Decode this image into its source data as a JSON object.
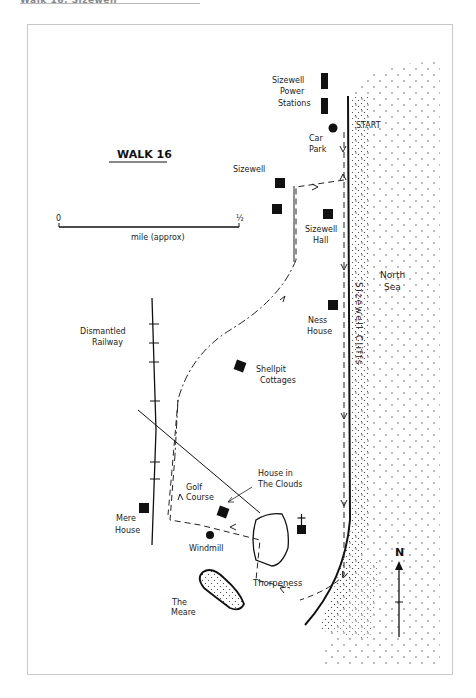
{
  "header": {
    "text": "Walk 16: Sizewell"
  },
  "map": {
    "title": "WALK 16",
    "scale": {
      "start": "0",
      "end": "½",
      "unit": "mile (approx)"
    },
    "labels": {
      "power_1": "Sizewell",
      "power_2": "Power",
      "power_3": "Stations",
      "start": "START",
      "carpark_1": "Car",
      "carpark_2": "Park",
      "sizewell": "Sizewell",
      "hall_1": "Sizewell",
      "hall_2": "Hall",
      "sea_1": "North",
      "sea_2": "Sea",
      "cliffs": "Sizewell Cliffs",
      "ness_1": "Ness",
      "ness_2": "House",
      "railway_1": "Dismantled",
      "railway_2": "Railway",
      "shellpit_1": "Shellpit",
      "shellpit_2": "Cottages",
      "clouds_1": "House in",
      "clouds_2": "The Clouds",
      "golf_1": "Golf",
      "golf_2": "Course",
      "mere_house_1": "Mere",
      "mere_house_2": "House",
      "windmill": "Windmill",
      "thorpeness": "Thorpeness",
      "meare_1": "The",
      "meare_2": "Meare",
      "north": "N"
    }
  }
}
